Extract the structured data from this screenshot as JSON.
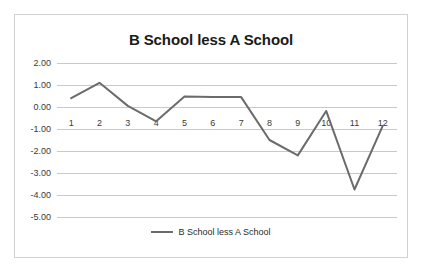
{
  "chart_data": {
    "type": "line",
    "title": "B School less A School",
    "xlabel": "",
    "ylabel": "",
    "categories": [
      "1",
      "2",
      "3",
      "4",
      "5",
      "6",
      "7",
      "8",
      "9",
      "10",
      "11",
      "12"
    ],
    "series": [
      {
        "name": "B School less A School",
        "values": [
          0.4,
          1.1,
          0.05,
          -0.65,
          0.48,
          0.45,
          0.45,
          -1.5,
          -2.2,
          -0.18,
          -3.75,
          -0.85
        ],
        "color": "#6b6b6b"
      }
    ],
    "ylim": [
      -5,
      2
    ],
    "ytick_labels": [
      "2.00",
      "1.00",
      "0.00",
      "-1.00",
      "-2.00",
      "-3.00",
      "-4.00",
      "-5.00"
    ],
    "ytick_values": [
      2,
      1,
      0,
      -1,
      -2,
      -3,
      -4,
      -5
    ],
    "grid": true,
    "legend_position": "bottom"
  },
  "legend": {
    "entries": [
      {
        "label": "B School less A School",
        "swatch": "line-swatch"
      }
    ]
  },
  "colors": {
    "series_line": "#6b6b6b",
    "gridline": "#c9c9c9",
    "border": "#d2d2d2",
    "text": "#1a1a1a",
    "background": "#ffffff"
  }
}
